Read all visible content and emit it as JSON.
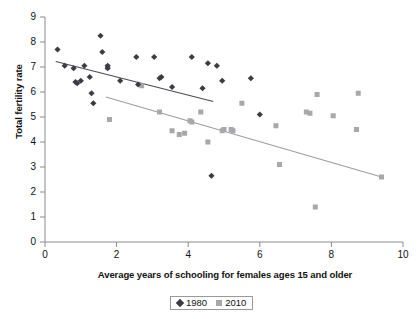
{
  "chart_data": {
    "type": "scatter",
    "title": "",
    "xlabel": "Average years of schooling for females ages 15 and older",
    "ylabel": "Total fertility rate",
    "xlim": [
      0,
      10
    ],
    "ylim": [
      0,
      9
    ],
    "xticks": [
      "0",
      "2",
      "4",
      "6",
      "8",
      "10"
    ],
    "xtick_values": [
      0,
      2,
      4,
      6,
      8,
      10
    ],
    "yticks": [
      "0",
      "1",
      "2",
      "3",
      "4",
      "5",
      "6",
      "7",
      "8",
      "9"
    ],
    "ytick_values": [
      0,
      1,
      2,
      3,
      4,
      5,
      6,
      7,
      8,
      9
    ],
    "grid": false,
    "legend_position": "below-axis-center",
    "series": [
      {
        "name": "1980",
        "marker": "diamond",
        "color": "#3c3c44",
        "points": [
          [
            0.35,
            7.7
          ],
          [
            0.55,
            7.05
          ],
          [
            0.8,
            6.95
          ],
          [
            0.85,
            6.4
          ],
          [
            0.9,
            6.35
          ],
          [
            1.0,
            6.45
          ],
          [
            1.1,
            7.05
          ],
          [
            1.25,
            6.6
          ],
          [
            1.3,
            5.95
          ],
          [
            1.35,
            5.55
          ],
          [
            1.55,
            8.25
          ],
          [
            1.6,
            7.6
          ],
          [
            1.75,
            6.95
          ],
          [
            1.75,
            7.05
          ],
          [
            2.1,
            6.45
          ],
          [
            2.55,
            7.4
          ],
          [
            2.6,
            6.3
          ],
          [
            3.05,
            7.4
          ],
          [
            3.2,
            6.55
          ],
          [
            3.25,
            6.6
          ],
          [
            3.55,
            6.2
          ],
          [
            4.1,
            7.4
          ],
          [
            4.4,
            6.15
          ],
          [
            4.55,
            7.15
          ],
          [
            4.65,
            2.65
          ],
          [
            4.8,
            7.05
          ],
          [
            4.95,
            6.45
          ],
          [
            5.75,
            6.55
          ],
          [
            6.0,
            5.1
          ]
        ]
      },
      {
        "name": "2010",
        "marker": "square",
        "color": "#a8a8ac",
        "points": [
          [
            1.75,
            7.0
          ],
          [
            1.8,
            4.9
          ],
          [
            2.7,
            6.25
          ],
          [
            3.2,
            5.2
          ],
          [
            3.55,
            4.45
          ],
          [
            3.75,
            4.3
          ],
          [
            3.9,
            4.35
          ],
          [
            4.05,
            4.85
          ],
          [
            4.1,
            4.8
          ],
          [
            4.35,
            5.2
          ],
          [
            4.55,
            4.0
          ],
          [
            4.95,
            4.45
          ],
          [
            5.0,
            4.5
          ],
          [
            5.2,
            4.5
          ],
          [
            5.25,
            4.45
          ],
          [
            5.5,
            5.55
          ],
          [
            6.45,
            4.65
          ],
          [
            6.55,
            3.1
          ],
          [
            7.3,
            5.2
          ],
          [
            7.4,
            5.15
          ],
          [
            7.55,
            1.4
          ],
          [
            7.6,
            5.9
          ],
          [
            8.05,
            5.05
          ],
          [
            8.7,
            4.5
          ],
          [
            8.75,
            5.95
          ],
          [
            9.4,
            2.6
          ]
        ]
      }
    ],
    "trendlines": [
      {
        "name": "1980 trend",
        "color": "#4a4a52",
        "x0": 0.3,
        "y0": 7.22,
        "x1": 4.7,
        "y1": 5.62
      },
      {
        "name": "2010 trend",
        "color": "#9e9ea2",
        "x0": 1.7,
        "y0": 5.8,
        "x1": 9.45,
        "y1": 2.58
      }
    ],
    "legend": [
      {
        "label": "1980",
        "marker": "diamond",
        "color": "#3c3c44"
      },
      {
        "label": "2010",
        "marker": "square",
        "color": "#a8a8ac"
      }
    ]
  }
}
